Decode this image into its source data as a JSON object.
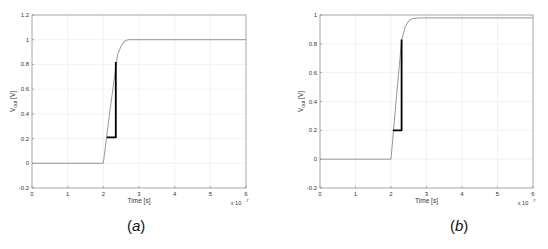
{
  "chart_data": [
    {
      "type": "line",
      "panel": "a",
      "caption": "a",
      "title": "",
      "xlabel": "Time [s]",
      "ylabel": "V_out [V]",
      "ylabel_main": "V",
      "ylabel_sub": "out",
      "ylabel_unit": " [V]",
      "x_multiplier": "x 10",
      "x_exponent": "-7",
      "xlim": [
        0,
        6
      ],
      "ylim": [
        -0.2,
        1.2
      ],
      "xticks": [
        "0",
        "1",
        "2",
        "3",
        "4",
        "5",
        "6"
      ],
      "yticks": [
        "-0.2",
        "0",
        "0.2",
        "0.4",
        "0.6",
        "0.8",
        "1",
        "1.2"
      ],
      "grid": true,
      "series": [
        {
          "name": "Vout response",
          "color": "#8c8c8c",
          "x": [
            0,
            2.0,
            2.2,
            2.4,
            2.5,
            2.6,
            2.7,
            2.8,
            6
          ],
          "y": [
            0,
            0,
            0.46,
            0.88,
            0.95,
            0.99,
            1.0,
            1.0,
            1.0
          ]
        },
        {
          "name": "measurement marker",
          "color": "#000000",
          "x": [
            2.1,
            2.35,
            2.35
          ],
          "y": [
            0.21,
            0.21,
            0.82
          ]
        }
      ]
    },
    {
      "type": "line",
      "panel": "b",
      "caption": "b",
      "title": "",
      "xlabel": "Time [s]",
      "ylabel": "V_out [V]",
      "ylabel_main": "V",
      "ylabel_sub": "out",
      "ylabel_unit": " [V]",
      "x_multiplier": "x 10",
      "x_exponent": "-7",
      "xlim": [
        0,
        6
      ],
      "ylim": [
        -0.2,
        1.0
      ],
      "xticks": [
        "0",
        "1",
        "2",
        "3",
        "4",
        "5",
        "6"
      ],
      "yticks": [
        "-0.2",
        "0",
        "0.2",
        "0.4",
        "0.6",
        "0.8",
        "1"
      ],
      "grid": true,
      "series": [
        {
          "name": "Vout response",
          "color": "#8c8c8c",
          "x": [
            0,
            2.0,
            2.15,
            2.3,
            2.4,
            2.5,
            2.6,
            2.8,
            6
          ],
          "y": [
            0,
            0,
            0.42,
            0.82,
            0.92,
            0.96,
            0.975,
            0.98,
            0.98
          ]
        },
        {
          "name": "measurement marker",
          "color": "#000000",
          "x": [
            2.05,
            2.3,
            2.3
          ],
          "y": [
            0.2,
            0.2,
            0.83
          ]
        }
      ]
    }
  ],
  "captions": {
    "a": "a",
    "b": "b"
  }
}
